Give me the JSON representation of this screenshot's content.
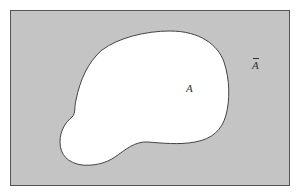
{
  "diagram": {
    "type": "venn",
    "universe": {
      "fill": "#c4c4c4",
      "stroke": "#555555",
      "label": "Ā",
      "label_base": "A",
      "label_decoration": "overbar"
    },
    "set_a": {
      "fill": "#ffffff",
      "stroke": "#444444",
      "label": "A"
    }
  }
}
